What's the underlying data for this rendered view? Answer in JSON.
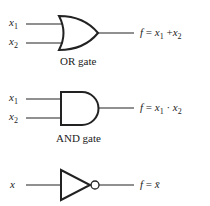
{
  "gates": [
    {
      "type": "OR",
      "caption": "OR gate",
      "inputs": [
        {
          "var": "x",
          "sub": "1"
        },
        {
          "var": "x",
          "sub": "2"
        }
      ],
      "output": {
        "f": "f",
        "eq": "=",
        "a": "x",
        "a_sub": "1",
        "op": "+",
        "b": "x",
        "b_sub": "2"
      }
    },
    {
      "type": "AND",
      "caption": "AND gate",
      "inputs": [
        {
          "var": "x",
          "sub": "1"
        },
        {
          "var": "x",
          "sub": "2"
        }
      ],
      "output": {
        "f": "f",
        "eq": "=",
        "a": "x",
        "a_sub": "1",
        "op": "·",
        "b": "x",
        "b_sub": "2"
      }
    },
    {
      "type": "NOT",
      "inputs": [
        {
          "var": "x"
        }
      ],
      "output": {
        "f": "f",
        "eq": "=",
        "a": "x̄"
      }
    }
  ]
}
